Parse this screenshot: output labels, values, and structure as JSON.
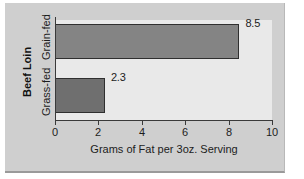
{
  "chart_data": {
    "type": "bar",
    "orientation": "horizontal",
    "title": "",
    "categories": [
      "Grain-fed",
      "Grass-fed"
    ],
    "values": [
      8.5,
      2.3
    ],
    "data_labels": [
      "8.5",
      "2.3"
    ],
    "xlabel": "Grams of Fat per 3oz. Serving",
    "ylabel": "Beef Loin",
    "xlim": [
      0,
      10
    ],
    "xticks": [
      0,
      2,
      4,
      6,
      8,
      10
    ],
    "xtick_labels": [
      "0",
      "2",
      "4",
      "6",
      "8",
      "10"
    ],
    "grid": false,
    "legend": false,
    "bar_colors": [
      "#848484",
      "#6f6f6f"
    ],
    "plot_background": "#e9e9e9",
    "figure_background": "#cfcfcf",
    "axis_color": "#3a3a3a"
  }
}
